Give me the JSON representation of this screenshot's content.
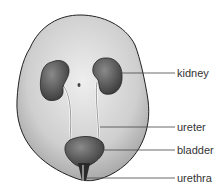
{
  "diagram": {
    "labels": [
      {
        "id": "kidney",
        "text": "kidney"
      },
      {
        "id": "ureter",
        "text": "ureter"
      },
      {
        "id": "bladder",
        "text": "bladder"
      },
      {
        "id": "urethra",
        "text": "urethra"
      }
    ]
  },
  "colors": {
    "body_fill": "#c8c8c8",
    "organ_fill": "#555555",
    "outline": "#222222",
    "leader_line": "#444444"
  }
}
